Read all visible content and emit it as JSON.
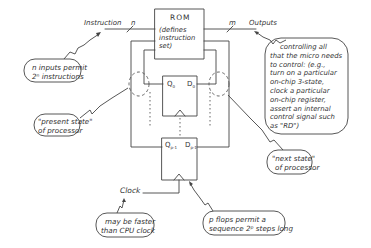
{
  "diagram": {
    "rom": {
      "title": "ROM",
      "subtitle_lines": [
        "(defines",
        "instruction",
        "set)"
      ]
    },
    "signals": {
      "input_label": "Instruction",
      "input_width": "n",
      "output_label": "Outputs",
      "output_width": "m",
      "clock_label": "Clock"
    },
    "flipflops": {
      "top": {
        "q": "Q",
        "q_sub": "0",
        "d": "D",
        "d_sub": "0"
      },
      "bottom": {
        "q": "Q",
        "q_sub": "p-1",
        "d": "D",
        "d_sub": "p-1"
      }
    },
    "annotations": {
      "inputs_note": [
        "n inputs permit",
        "2ⁿ instructions"
      ],
      "present_state": [
        "\"present state\"",
        "of processor"
      ],
      "next_state": [
        "\"next state\"",
        "of processor"
      ],
      "outputs_note": [
        "controlling all",
        "that the micro needs",
        "to control: (e.g.,",
        "turn on a particular",
        "on-chip 3-state,",
        "clock a particular",
        "on-chip register,",
        "assert an internal",
        "control signal such",
        "as \"RD\")"
      ],
      "clock_note": [
        "may be faster",
        "than CPU clock"
      ],
      "flops_note": [
        "p flops permit a",
        "sequence 2ᵖ steps long"
      ]
    },
    "colors": {
      "ink": "#333333",
      "background": "#ffffff"
    }
  }
}
